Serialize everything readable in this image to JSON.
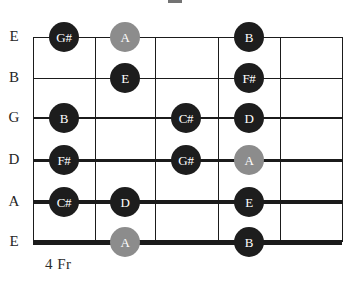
{
  "diagram": {
    "type": "guitar-fretboard",
    "instrument": "guitar",
    "position_label": "4 Fr",
    "strings_top_to_bottom": [
      "E",
      "B",
      "G",
      "D",
      "A",
      "E"
    ],
    "fret_count": 5,
    "colors": {
      "root_dot": "#8c8c8c",
      "note_dot": "#1d1d1d",
      "grid_line": "#1b1b1b",
      "label_text": "#262626",
      "dot_text": "#ffffff",
      "background": "#ffffff"
    },
    "geometry": {
      "grid_left": 33,
      "grid_right": 342,
      "grid_top": 37,
      "grid_bottom": 242,
      "fret_x": [
        33,
        95,
        155,
        218,
        280,
        342
      ],
      "string_y": [
        37,
        78,
        118,
        160,
        202,
        242
      ],
      "string_thickness": [
        1,
        1,
        2,
        3,
        4,
        5
      ],
      "fret_center_x": [
        64,
        125,
        186,
        249,
        311
      ],
      "dot_diameter": 30
    },
    "string_labels": [
      {
        "name": "E",
        "y": 37
      },
      {
        "name": "B",
        "y": 78
      },
      {
        "name": "G",
        "y": 118
      },
      {
        "name": "D",
        "y": 160
      },
      {
        "name": "A",
        "y": 202
      },
      {
        "name": "E",
        "y": 242
      }
    ],
    "notes": [
      {
        "note": "G#",
        "string": "E-high",
        "string_index": 0,
        "fret": 1,
        "x": 64,
        "y": 37,
        "style": "normal"
      },
      {
        "note": "A",
        "string": "E-high",
        "string_index": 0,
        "fret": 2,
        "x": 125,
        "y": 37,
        "style": "root"
      },
      {
        "note": "B",
        "string": "E-high",
        "string_index": 0,
        "fret": 4,
        "x": 249,
        "y": 37,
        "style": "normal"
      },
      {
        "note": "E",
        "string": "B",
        "string_index": 1,
        "fret": 2,
        "x": 125,
        "y": 78,
        "style": "normal"
      },
      {
        "note": "F#",
        "string": "B",
        "string_index": 1,
        "fret": 4,
        "x": 249,
        "y": 78,
        "style": "normal"
      },
      {
        "note": "B",
        "string": "G",
        "string_index": 2,
        "fret": 1,
        "x": 64,
        "y": 118,
        "style": "normal"
      },
      {
        "note": "C#",
        "string": "G",
        "string_index": 2,
        "fret": 3,
        "x": 186,
        "y": 118,
        "style": "normal"
      },
      {
        "note": "D",
        "string": "G",
        "string_index": 2,
        "fret": 4,
        "x": 249,
        "y": 118,
        "style": "normal"
      },
      {
        "note": "F#",
        "string": "D",
        "string_index": 3,
        "fret": 1,
        "x": 64,
        "y": 160,
        "style": "normal"
      },
      {
        "note": "G#",
        "string": "D",
        "string_index": 3,
        "fret": 3,
        "x": 186,
        "y": 160,
        "style": "normal"
      },
      {
        "note": "A",
        "string": "D",
        "string_index": 3,
        "fret": 4,
        "x": 249,
        "y": 160,
        "style": "root"
      },
      {
        "note": "C#",
        "string": "A",
        "string_index": 4,
        "fret": 1,
        "x": 64,
        "y": 202,
        "style": "normal"
      },
      {
        "note": "D",
        "string": "A",
        "string_index": 4,
        "fret": 2,
        "x": 125,
        "y": 202,
        "style": "normal"
      },
      {
        "note": "E",
        "string": "A",
        "string_index": 4,
        "fret": 4,
        "x": 249,
        "y": 202,
        "style": "normal"
      },
      {
        "note": "A",
        "string": "E-low",
        "string_index": 5,
        "fret": 2,
        "x": 125,
        "y": 242,
        "style": "root"
      },
      {
        "note": "B",
        "string": "E-low",
        "string_index": 5,
        "fret": 4,
        "x": 249,
        "y": 242,
        "style": "normal"
      }
    ]
  }
}
